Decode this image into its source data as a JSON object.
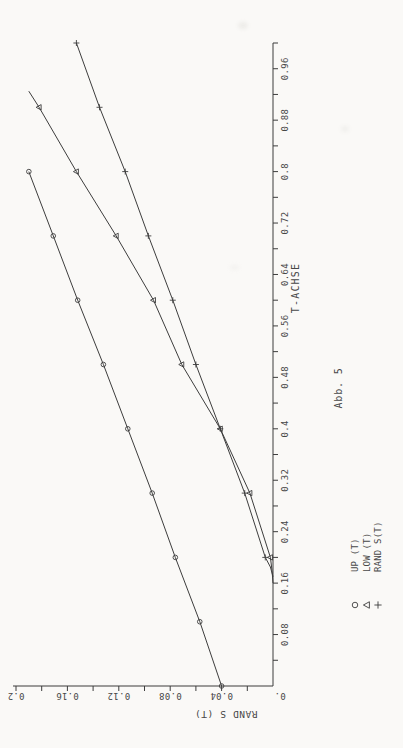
{
  "colors": {
    "ink": "#3d3d3d",
    "paper": "#faf9f7",
    "text": "#474747"
  },
  "chart_data": {
    "type": "line",
    "title": "",
    "caption": "Abb. 5",
    "xlabel": "T-ACHSE",
    "ylabel": "RAND S (T)",
    "origin_label": "0.",
    "xlim": [
      0,
      1.0
    ],
    "ylim": [
      0,
      0.2
    ],
    "grid": "off",
    "x_minor_tick_step": 0.04,
    "y_minor_tick_step": 0.02,
    "x_tick_values": [
      0.08,
      0.16,
      0.24,
      0.32,
      0.4,
      0.48,
      0.56,
      0.64,
      0.72,
      0.8,
      0.88,
      0.96
    ],
    "x_tick_labels": [
      "0.08",
      "0.16",
      "0.24",
      "0.32",
      "0.4",
      "0.48",
      "0.56",
      "0.64",
      "0.72",
      "0.8",
      "0.88",
      "0.96"
    ],
    "y_tick_values": [
      0.04,
      0.08,
      0.12,
      0.16,
      0.2
    ],
    "y_tick_labels": [
      "0.04",
      "0.08",
      "0.12",
      "0.16",
      "0.2"
    ],
    "legend_position": "below-left",
    "series": [
      {
        "name": "UP (T)",
        "marker": "circle",
        "line_points": [
          [
            0,
            0.04
          ],
          [
            0.1,
            0.057
          ],
          [
            0.2,
            0.076
          ],
          [
            0.3,
            0.094
          ],
          [
            0.4,
            0.113
          ],
          [
            0.5,
            0.132
          ],
          [
            0.6,
            0.152
          ],
          [
            0.7,
            0.171
          ],
          [
            0.8,
            0.19
          ]
        ],
        "marker_points": [
          [
            0,
            0.04
          ],
          [
            0.1,
            0.057
          ],
          [
            0.2,
            0.076
          ],
          [
            0.3,
            0.094
          ],
          [
            0.4,
            0.113
          ],
          [
            0.5,
            0.132
          ],
          [
            0.6,
            0.152
          ],
          [
            0.7,
            0.171
          ],
          [
            0.8,
            0.19
          ]
        ]
      },
      {
        "name": "LOW (T)",
        "marker": "triangle",
        "line_points": [
          [
            0.16,
            0
          ],
          [
            0.18,
            0.0008
          ],
          [
            0.2,
            0.002
          ],
          [
            0.3,
            0.018
          ],
          [
            0.4,
            0.041
          ],
          [
            0.5,
            0.071
          ],
          [
            0.6,
            0.093
          ],
          [
            0.7,
            0.122
          ],
          [
            0.8,
            0.153
          ],
          [
            0.9,
            0.182
          ],
          [
            0.925,
            0.19
          ]
        ],
        "marker_points": [
          [
            0.2,
            0.002
          ],
          [
            0.3,
            0.018
          ],
          [
            0.4,
            0.041
          ],
          [
            0.5,
            0.071
          ],
          [
            0.6,
            0.093
          ],
          [
            0.7,
            0.122
          ],
          [
            0.8,
            0.153
          ],
          [
            0.9,
            0.182
          ]
        ]
      },
      {
        "name": "RAND S(T)",
        "marker": "plus",
        "line_points": [
          [
            0.17,
            0
          ],
          [
            0.185,
            0.002
          ],
          [
            0.2,
            0.006
          ],
          [
            0.3,
            0.022
          ],
          [
            0.4,
            0.041
          ],
          [
            0.5,
            0.06
          ],
          [
            0.6,
            0.078
          ],
          [
            0.7,
            0.097
          ],
          [
            0.8,
            0.115
          ],
          [
            0.9,
            0.135
          ],
          [
            1.0,
            0.153
          ]
        ],
        "marker_points": [
          [
            0.2,
            0.006
          ],
          [
            0.3,
            0.022
          ],
          [
            0.4,
            0.041
          ],
          [
            0.5,
            0.06
          ],
          [
            0.6,
            0.078
          ],
          [
            0.7,
            0.097
          ],
          [
            0.8,
            0.115
          ],
          [
            0.9,
            0.135
          ],
          [
            1.0,
            0.153
          ]
        ]
      }
    ]
  }
}
